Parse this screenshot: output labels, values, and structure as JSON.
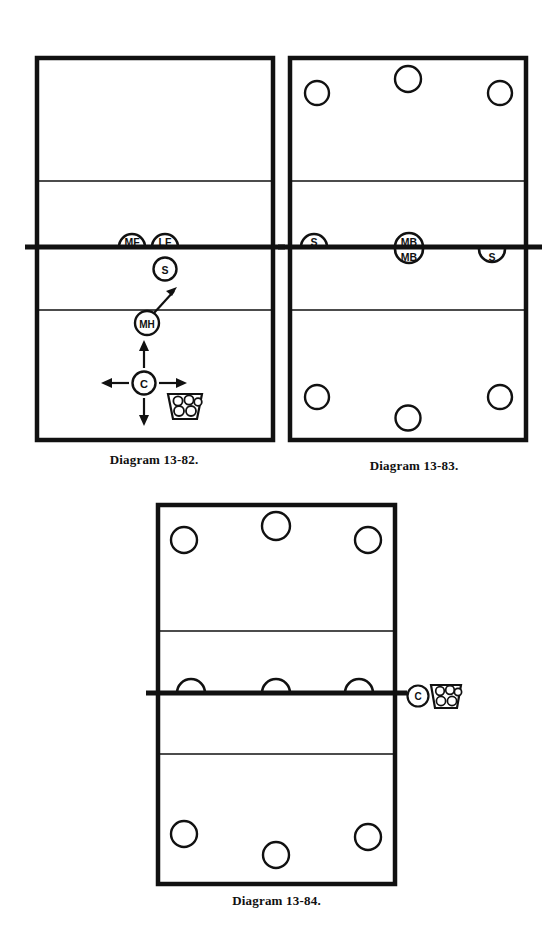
{
  "page": {
    "background_color": "#ffffff",
    "ink_color": "#111111",
    "width": 556,
    "height": 926
  },
  "legend": {
    "circle_marker": "player-circle",
    "arc_marker": "player-arc-at-net",
    "coach_marker": "C",
    "ball_cart_marker": "ball-cart",
    "arrow_marker": "movement-arrow"
  },
  "figures": [
    {
      "id": "13-82",
      "caption": "Diagram 13-82.",
      "court": {
        "outline": "volleyball-court",
        "net_line": "net",
        "attack_lines": 2
      },
      "markers": [
        {
          "name": "middle-front",
          "label": "MF",
          "shape": "arc-down",
          "side": "far",
          "position": "net-center-left"
        },
        {
          "name": "left-front",
          "label": "LF",
          "shape": "arc-down",
          "side": "far",
          "position": "net-center-right"
        },
        {
          "name": "setter",
          "label": "S",
          "shape": "circle",
          "side": "near",
          "position": "front-center"
        },
        {
          "name": "middle-hitter",
          "label": "MH",
          "shape": "circle",
          "side": "near",
          "position": "attack-line-center",
          "arrow": "up-right"
        },
        {
          "name": "coach",
          "label": "C",
          "shape": "circle",
          "side": "near",
          "position": "back-court-left",
          "arrows": [
            "up",
            "down",
            "left",
            "right"
          ]
        },
        {
          "name": "ball-cart",
          "label": "",
          "shape": "cart",
          "side": "near",
          "position": "beside-coach"
        }
      ]
    },
    {
      "id": "13-83",
      "caption": "Diagram 13-83.",
      "court": {
        "outline": "volleyball-court",
        "net_line": "net",
        "attack_lines": 2
      },
      "markers": [
        {
          "name": "player-far-back-left",
          "label": "",
          "shape": "circle",
          "side": "far",
          "position": "back-left"
        },
        {
          "name": "player-far-back-center",
          "label": "",
          "shape": "circle",
          "side": "far",
          "position": "back-center"
        },
        {
          "name": "player-far-back-right",
          "label": "",
          "shape": "circle",
          "side": "far",
          "position": "back-right"
        },
        {
          "name": "setter-far",
          "label": "S",
          "shape": "arc-down",
          "side": "far",
          "position": "net-left"
        },
        {
          "name": "middle-blocker-far",
          "label": "MB",
          "shape": "arc-down",
          "side": "far",
          "position": "net-center"
        },
        {
          "name": "middle-blocker-near",
          "label": "MB",
          "shape": "arc-up",
          "side": "near",
          "position": "net-center"
        },
        {
          "name": "setter-near",
          "label": "S",
          "shape": "arc-up",
          "side": "near",
          "position": "net-right"
        },
        {
          "name": "player-near-back-left",
          "label": "",
          "shape": "circle",
          "side": "near",
          "position": "back-left"
        },
        {
          "name": "player-near-back-center",
          "label": "",
          "shape": "circle",
          "side": "near",
          "position": "back-center"
        },
        {
          "name": "player-near-back-right",
          "label": "",
          "shape": "circle",
          "side": "near",
          "position": "back-right"
        }
      ]
    },
    {
      "id": "13-84",
      "caption": "Diagram 13-84.",
      "court": {
        "outline": "volleyball-court",
        "net_line": "net",
        "attack_lines": 2
      },
      "markers": [
        {
          "name": "player-far-back-left",
          "label": "",
          "shape": "circle",
          "side": "far",
          "position": "back-left"
        },
        {
          "name": "player-far-back-center",
          "label": "",
          "shape": "circle",
          "side": "far",
          "position": "back-center"
        },
        {
          "name": "player-far-back-right",
          "label": "",
          "shape": "circle",
          "side": "far",
          "position": "back-right"
        },
        {
          "name": "blocker-left",
          "label": "",
          "shape": "arc-down",
          "side": "far",
          "position": "net-left"
        },
        {
          "name": "blocker-center",
          "label": "",
          "shape": "arc-down",
          "side": "far",
          "position": "net-center"
        },
        {
          "name": "blocker-right",
          "label": "",
          "shape": "arc-down",
          "side": "far",
          "position": "net-right"
        },
        {
          "name": "coach",
          "label": "C",
          "shape": "circle",
          "side": "sideline",
          "position": "net-right-outside"
        },
        {
          "name": "ball-cart",
          "label": "",
          "shape": "cart",
          "side": "sideline",
          "position": "beside-coach"
        },
        {
          "name": "player-near-back-left",
          "label": "",
          "shape": "circle",
          "side": "near",
          "position": "back-left"
        },
        {
          "name": "player-near-back-center",
          "label": "",
          "shape": "circle",
          "side": "near",
          "position": "back-center"
        },
        {
          "name": "player-near-back-right",
          "label": "",
          "shape": "circle",
          "side": "near",
          "position": "back-right"
        }
      ]
    }
  ]
}
